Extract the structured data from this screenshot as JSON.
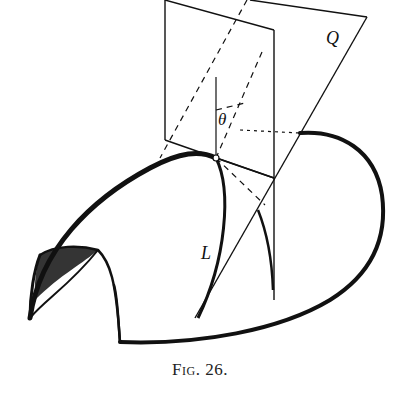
{
  "figure": {
    "labels": {
      "plane_q": "Q",
      "angle": "θ",
      "curve": "L"
    },
    "caption": {
      "prefix": "Fig.",
      "number": "26."
    },
    "colors": {
      "ink": "#111111",
      "background": "#ffffff"
    }
  }
}
